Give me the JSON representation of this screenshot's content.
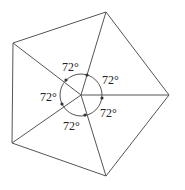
{
  "diagram": {
    "type": "regular-pentagon-central-angles",
    "center": [
      81,
      95
    ],
    "vertices": [
      [
        106,
        12
      ],
      [
        169,
        95
      ],
      [
        106,
        176
      ],
      [
        12,
        143
      ],
      [
        13,
        43
      ]
    ],
    "circle_radius": 21,
    "angle_labels": [
      {
        "text": "72°",
        "x": 62,
        "y": 71
      },
      {
        "text": "72°",
        "x": 102,
        "y": 84
      },
      {
        "text": "72°",
        "x": 100,
        "y": 117
      },
      {
        "text": "72°",
        "x": 63,
        "y": 130
      },
      {
        "text": "72°",
        "x": 40,
        "y": 101
      }
    ],
    "stroke_color": "#555555"
  }
}
